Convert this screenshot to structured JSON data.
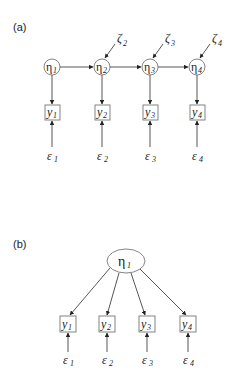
{
  "panels": {
    "a": {
      "label": "(a)",
      "latent": [
        {
          "symbol": "η",
          "sub": "1",
          "cx": 52,
          "cy": 67
        },
        {
          "symbol": "η",
          "sub": "2",
          "cx": 102,
          "cy": 67
        },
        {
          "symbol": "η",
          "sub": "3",
          "cx": 150,
          "cy": 67
        },
        {
          "symbol": "η",
          "sub": "4",
          "cx": 197,
          "cy": 67
        }
      ],
      "disturbances": [
        {
          "symbol": "ζ",
          "sub": "2"
        },
        {
          "symbol": "ζ",
          "sub": "3"
        },
        {
          "symbol": "ζ",
          "sub": "4"
        }
      ],
      "observed": [
        {
          "symbol": "y",
          "sub": "1"
        },
        {
          "symbol": "y",
          "sub": "2"
        },
        {
          "symbol": "y",
          "sub": "3"
        },
        {
          "symbol": "y",
          "sub": "4"
        }
      ],
      "errors": [
        {
          "symbol": "ε",
          "sub": "1"
        },
        {
          "symbol": "ε",
          "sub": "2"
        },
        {
          "symbol": "ε",
          "sub": "3"
        },
        {
          "symbol": "ε",
          "sub": "4"
        }
      ]
    },
    "b": {
      "label": "(b)",
      "latent": {
        "symbol": "η",
        "sub": "1"
      },
      "observed": [
        {
          "symbol": "y",
          "sub": "1"
        },
        {
          "symbol": "y",
          "sub": "2"
        },
        {
          "symbol": "y",
          "sub": "3"
        },
        {
          "symbol": "y",
          "sub": "4"
        }
      ],
      "errors": [
        {
          "symbol": "ε",
          "sub": "1"
        },
        {
          "symbol": "ε",
          "sub": "2"
        },
        {
          "symbol": "ε",
          "sub": "3"
        },
        {
          "symbol": "ε",
          "sub": "4"
        }
      ]
    }
  }
}
